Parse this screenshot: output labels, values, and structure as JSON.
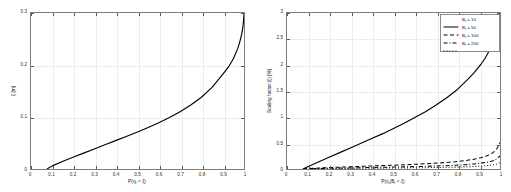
{
  "figure": {
    "background": "#ffffff",
    "curve_color": "#000000",
    "grid_color": "#ececec",
    "axis_color": "#7d7d7d"
  },
  "panels": [
    {
      "letter": "A",
      "xlabel_main": "P(",
      "xlabel_sym": "η",
      "xlabel_sub": "r",
      "xlabel_tail": " < ξ)",
      "ylabel_sym": "ξ",
      "ylabel_tail": " [m]",
      "x_ticks": [
        "0",
        "0.1",
        "0.2",
        "0.3",
        "0.4",
        "0.5",
        "0.6",
        "0.7",
        "0.8",
        "0.9",
        "1"
      ],
      "y_ticks": [
        "0",
        "0.1",
        "0.2",
        "0.3"
      ]
    },
    {
      "letter": "B",
      "xlabel_main": "P(",
      "xlabel_sym": "η",
      "xlabel_sub": "r",
      "xlabel_mid": "|B",
      "xlabel_sub2": "r",
      "xlabel_tail": " < ξ)",
      "ylabel_text": "Scaling factor (ξ) [%]",
      "x_ticks": [
        "0",
        "0.1",
        "0.2",
        "0.3",
        "0.4",
        "0.5",
        "0.6",
        "0.7",
        "0.8",
        "0.9",
        "1"
      ],
      "y_ticks": [
        "0",
        "0.5",
        "1",
        "1.5",
        "2",
        "2.5",
        "3"
      ]
    }
  ],
  "legend": {
    "position": "top-right",
    "entries": [
      {
        "label_sym": "B",
        "label_sub": "r",
        "label_val": " = 10",
        "style": "solid"
      },
      {
        "label_sym": "B",
        "label_sub": "r",
        "label_val": " = 50",
        "style": "dashed"
      },
      {
        "label_sym": "B",
        "label_sub": "r",
        "label_val": " = 100",
        "style": "dashdot"
      },
      {
        "label_sym": "B",
        "label_sub": "r",
        "label_val": " = 200",
        "style": "dotted"
      }
    ]
  },
  "chart_data": [
    {
      "type": "line",
      "panel": "A",
      "title": "A",
      "xlabel": "P(ηr < ξ)",
      "ylabel": "ξ [m]",
      "xlim": [
        0,
        1
      ],
      "ylim": [
        0,
        0.3
      ],
      "grid": true,
      "legend": "none",
      "xticks": [
        0,
        0.1,
        0.2,
        0.3,
        0.4,
        0.5,
        0.6,
        0.7,
        0.8,
        0.9,
        1
      ],
      "yticks": [
        0,
        0.1,
        0.2,
        0.3
      ],
      "series": [
        {
          "name": "xi",
          "style": "solid",
          "color": "#000000",
          "x": [
            0.075,
            0.1,
            0.15,
            0.2,
            0.25,
            0.3,
            0.35,
            0.4,
            0.45,
            0.5,
            0.55,
            0.6,
            0.65,
            0.7,
            0.75,
            0.8,
            0.85,
            0.9,
            0.93,
            0.95,
            0.97,
            0.98,
            0.99,
            0.995,
            0.998,
            1.0
          ],
          "y": [
            0.0,
            0.006,
            0.015,
            0.023,
            0.031,
            0.039,
            0.047,
            0.055,
            0.063,
            0.071,
            0.08,
            0.089,
            0.099,
            0.11,
            0.123,
            0.138,
            0.157,
            0.182,
            0.198,
            0.212,
            0.231,
            0.244,
            0.261,
            0.273,
            0.286,
            0.3
          ]
        }
      ]
    },
    {
      "type": "line",
      "panel": "B",
      "title": "B",
      "xlabel": "P(ηr|Br < ξ)",
      "ylabel": "Scaling factor (ξ) [%]",
      "xlim": [
        0,
        1
      ],
      "ylim": [
        0,
        3
      ],
      "grid": true,
      "legend": "top-right",
      "xticks": [
        0,
        0.1,
        0.2,
        0.3,
        0.4,
        0.5,
        0.6,
        0.7,
        0.8,
        0.9,
        1
      ],
      "yticks": [
        0,
        0.5,
        1,
        1.5,
        2,
        2.5,
        3
      ],
      "series": [
        {
          "name": "Br = 10",
          "style": "solid",
          "color": "#000000",
          "x": [
            0.075,
            0.1,
            0.15,
            0.2,
            0.25,
            0.3,
            0.35,
            0.4,
            0.45,
            0.5,
            0.55,
            0.6,
            0.65,
            0.7,
            0.75,
            0.8,
            0.85,
            0.88,
            0.91,
            0.93,
            0.95,
            0.965,
            0.978,
            0.988,
            0.995,
            1.0
          ],
          "y": [
            0.0,
            0.05,
            0.14,
            0.23,
            0.32,
            0.41,
            0.5,
            0.59,
            0.68,
            0.78,
            0.88,
            0.99,
            1.1,
            1.23,
            1.37,
            1.53,
            1.73,
            1.86,
            2.01,
            2.13,
            2.28,
            2.42,
            2.58,
            2.74,
            2.88,
            3.0
          ]
        },
        {
          "name": "Br = 50",
          "style": "dashed",
          "color": "#000000",
          "x": [
            0.075,
            0.12,
            0.18,
            0.25,
            0.32,
            0.4,
            0.48,
            0.55,
            0.62,
            0.68,
            0.74,
            0.79,
            0.84,
            0.88,
            0.91,
            0.94,
            0.96,
            0.975,
            0.985,
            0.993,
            1.0
          ],
          "y": [
            0.0,
            0.012,
            0.024,
            0.036,
            0.047,
            0.059,
            0.07,
            0.081,
            0.094,
            0.107,
            0.123,
            0.14,
            0.163,
            0.19,
            0.218,
            0.256,
            0.295,
            0.34,
            0.39,
            0.445,
            0.51
          ]
        },
        {
          "name": "Br = 100",
          "style": "dashdot",
          "color": "#000000",
          "x": [
            0.075,
            0.12,
            0.18,
            0.25,
            0.32,
            0.4,
            0.48,
            0.55,
            0.62,
            0.68,
            0.74,
            0.79,
            0.84,
            0.88,
            0.91,
            0.94,
            0.96,
            0.975,
            0.985,
            0.993,
            1.0
          ],
          "y": [
            0.0,
            0.006,
            0.012,
            0.018,
            0.024,
            0.03,
            0.036,
            0.041,
            0.048,
            0.055,
            0.063,
            0.072,
            0.084,
            0.098,
            0.112,
            0.131,
            0.15,
            0.172,
            0.196,
            0.222,
            0.255
          ]
        },
        {
          "name": "Br = 200",
          "style": "dotted",
          "color": "#000000",
          "x": [
            0.075,
            0.12,
            0.18,
            0.25,
            0.32,
            0.4,
            0.48,
            0.55,
            0.62,
            0.68,
            0.74,
            0.79,
            0.84,
            0.88,
            0.91,
            0.94,
            0.96,
            0.975,
            0.985,
            0.993,
            1.0
          ],
          "y": [
            0.0,
            0.003,
            0.006,
            0.009,
            0.012,
            0.015,
            0.018,
            0.021,
            0.024,
            0.028,
            0.032,
            0.036,
            0.042,
            0.049,
            0.056,
            0.066,
            0.075,
            0.086,
            0.098,
            0.111,
            0.128
          ]
        }
      ]
    }
  ]
}
